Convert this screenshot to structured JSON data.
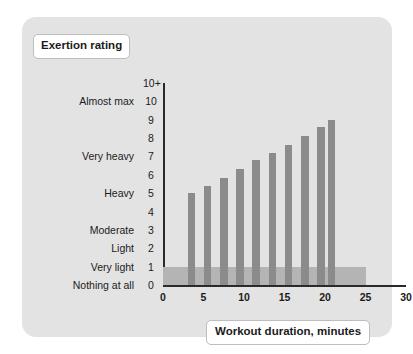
{
  "card": {
    "background": "#e3e3e3",
    "page_background": "#ffffff"
  },
  "labels": {
    "y_axis_title": "Exertion rating",
    "x_axis_title": "Workout duration, minutes"
  },
  "chart_data": {
    "type": "bar",
    "title": "",
    "subtitle": "",
    "xlabel": "Workout duration, minutes",
    "ylabel": "Exertion rating",
    "xlim": [
      0,
      30
    ],
    "ylim": [
      0,
      11
    ],
    "grid": false,
    "legend": null,
    "bar_color": "#8b8b8b",
    "band_color": "#b4b4b4",
    "axis_color": "#2a2a2a",
    "x_ticks": [
      0,
      5,
      10,
      15,
      20,
      25,
      30
    ],
    "x_tick_labels": [
      "0",
      "5",
      "10",
      "15",
      "20",
      "25",
      "30"
    ],
    "y_ticks": [
      0,
      1,
      2,
      3,
      4,
      5,
      6,
      7,
      8,
      9,
      10,
      11
    ],
    "y_tick_labels": [
      "0",
      "1",
      "2",
      "3",
      "4",
      "5",
      "6",
      "7",
      "8",
      "9",
      "10",
      "10+"
    ],
    "y_tick_descriptions": [
      "Nothing at all",
      "Very light",
      "Light",
      "Moderate",
      "",
      "Heavy",
      "",
      "Very heavy",
      "",
      "",
      "Almost max",
      ""
    ],
    "x": [
      3.5,
      5.5,
      7.5,
      9.5,
      11.5,
      13.5,
      15.5,
      17.5,
      19.5,
      20.8
    ],
    "values": [
      5.0,
      5.4,
      5.8,
      6.3,
      6.8,
      7.2,
      7.6,
      8.1,
      8.6,
      9.0
    ],
    "bar_width": 0.95,
    "annotations": [
      {
        "type": "shaded-band",
        "note": "warm-up / cool-down zone",
        "x_range": [
          0,
          25
        ],
        "y_range": [
          0,
          1
        ]
      }
    ]
  }
}
